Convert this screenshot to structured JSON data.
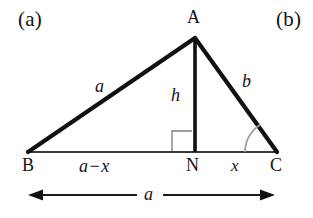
{
  "figure": {
    "panel_tags": [
      {
        "name": "panel-a",
        "text": "(a)",
        "x": 18,
        "y": 9
      },
      {
        "name": "panel-b",
        "text": "(b)",
        "x": 276,
        "y": 9
      }
    ],
    "vertices": [
      {
        "key": "A",
        "label": "A",
        "px": 195,
        "py": 38,
        "label_x": 187,
        "label_y": 8
      },
      {
        "key": "B",
        "label": "B",
        "px": 28,
        "py": 152,
        "label_x": 22,
        "label_y": 156
      },
      {
        "key": "C",
        "label": "C",
        "px": 277,
        "py": 152,
        "label_x": 270,
        "label_y": 156
      },
      {
        "key": "N",
        "label": "N",
        "px": 195,
        "py": 152,
        "label_x": 186,
        "label_y": 156
      }
    ],
    "side_labels": [
      {
        "name": "side-label-a",
        "text": "a",
        "x": 95,
        "y": 77
      },
      {
        "name": "side-label-b",
        "text": "b",
        "x": 242,
        "y": 72
      },
      {
        "name": "altitude-label-h",
        "text": "h",
        "x": 171,
        "y": 86
      }
    ],
    "segment_labels": [
      {
        "name": "segment-label-a-minus-x",
        "lhs": "a",
        "op": "−",
        "rhs": "x",
        "x": 79,
        "y": 157
      },
      {
        "name": "segment-label-x",
        "text": "x",
        "x": 231,
        "y": 157
      }
    ],
    "dimension": {
      "name": "base-dimension-arrow",
      "label": "a",
      "label_x": 144,
      "label_y": 185,
      "x_start": 28,
      "x_end": 275,
      "y": 195
    },
    "markers": {
      "right_angle": {
        "name": "right-angle-marker",
        "x": 172,
        "y": 131,
        "size": 20
      },
      "angle_arc": {
        "name": "angle-arc-c",
        "cx": 277,
        "cy": 152,
        "radius": 32
      }
    },
    "colors": {
      "stroke": "#111111",
      "base_stroke": "#3a3a3a",
      "marker_stroke": "#9a9a9a",
      "background": "#ffffff",
      "text": "#131313"
    },
    "geometry_description": "triangle-with-altitude"
  }
}
